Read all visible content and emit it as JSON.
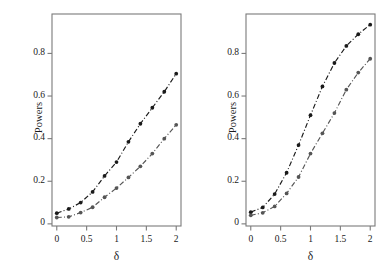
{
  "figure": {
    "background": "#ffffff",
    "panel_count": 2
  },
  "chart_data": [
    {
      "type": "line",
      "panel": "left",
      "title": "",
      "xlabel": "δ",
      "ylabel": "Powers",
      "x": [
        0,
        0.2,
        0.4,
        0.6,
        0.8,
        1.0,
        1.2,
        1.4,
        1.6,
        1.8,
        2.0
      ],
      "xlim": [
        -0.08,
        2.08
      ],
      "ylim": [
        -0.01,
        0.985
      ],
      "xticks": [
        0,
        0.5,
        1,
        1.5,
        2
      ],
      "xticklabels": [
        "0",
        "0.5",
        "1",
        "1.5",
        "2"
      ],
      "yticks": [
        0,
        0.2,
        0.4,
        0.6,
        0.8
      ],
      "yticklabels": [
        "0",
        "0.2",
        "0.4",
        "0.6",
        "0.8"
      ],
      "grid": false,
      "legend": "none",
      "series": [
        {
          "name": "upper-curve",
          "color": "#1a1a1a",
          "linestyle": "dashdot",
          "marker": "filled-circle",
          "values": [
            0.05,
            0.07,
            0.1,
            0.15,
            0.225,
            0.29,
            0.385,
            0.47,
            0.545,
            0.62,
            0.705
          ]
        },
        {
          "name": "lower-curve",
          "color": "#555555",
          "linestyle": "dashdot",
          "marker": "filled-circle",
          "values": [
            0.03,
            0.033,
            0.053,
            0.078,
            0.125,
            0.168,
            0.218,
            0.27,
            0.33,
            0.4,
            0.465
          ]
        }
      ]
    },
    {
      "type": "line",
      "panel": "right",
      "title": "",
      "xlabel": "δ",
      "ylabel": "Powers",
      "x": [
        0,
        0.2,
        0.4,
        0.6,
        0.8,
        1.0,
        1.2,
        1.4,
        1.6,
        1.8,
        2.0
      ],
      "xlim": [
        -0.08,
        2.08
      ],
      "ylim": [
        -0.01,
        0.985
      ],
      "xticks": [
        0,
        0.5,
        1,
        1.5,
        2
      ],
      "xticklabels": [
        "0",
        "0.5",
        "1",
        "1.5",
        "2"
      ],
      "yticks": [
        0,
        0.2,
        0.4,
        0.6,
        0.8
      ],
      "yticklabels": [
        "0",
        "0.2",
        "0.4",
        "0.6",
        "0.8"
      ],
      "grid": false,
      "legend": "none",
      "series": [
        {
          "name": "upper-curve",
          "color": "#1a1a1a",
          "linestyle": "dashdot",
          "marker": "filled-circle",
          "values": [
            0.055,
            0.077,
            0.14,
            0.24,
            0.37,
            0.51,
            0.645,
            0.755,
            0.835,
            0.89,
            0.935
          ]
        },
        {
          "name": "lower-curve",
          "color": "#555555",
          "linestyle": "dashdot",
          "marker": "filled-circle",
          "values": [
            0.04,
            0.052,
            0.082,
            0.143,
            0.22,
            0.33,
            0.425,
            0.52,
            0.63,
            0.71,
            0.775
          ]
        }
      ]
    }
  ]
}
